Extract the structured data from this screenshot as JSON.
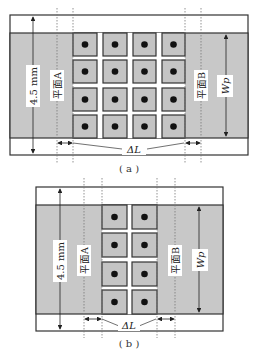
{
  "colors": {
    "band_fill": "#c8c8c8",
    "box_fill": "#c4c4c4",
    "stroke": "#333333",
    "dot": "#111111",
    "background": "#ffffff"
  },
  "figures": [
    {
      "id": "a",
      "caption": "( a )",
      "height_label": "4.5 mm",
      "plane_a_label": "平面A",
      "plane_b_label": "平面B",
      "width_label": "Wp",
      "delta_label": "ΔL",
      "grid": {
        "rows": 4,
        "cols": 4
      }
    },
    {
      "id": "b",
      "caption": "( b )",
      "height_label": "4.5 mm",
      "plane_a_label": "平面A",
      "plane_b_label": "平面B",
      "width_label": "Wp",
      "delta_label": "ΔL",
      "grid": {
        "rows": 4,
        "cols": 2
      }
    }
  ]
}
